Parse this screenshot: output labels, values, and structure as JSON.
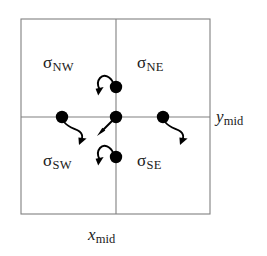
{
  "figure": {
    "background_color": "#ffffff",
    "line_color": "#808080",
    "marker_color": "#000000",
    "text_color": "#1a1a1a",
    "cell": {
      "left": 21,
      "top": 19,
      "right": 210,
      "bottom": 214,
      "mid_x": 116,
      "mid_y": 117
    },
    "quadrant_labels": [
      {
        "id": "sigma-nw",
        "symbol": "σ",
        "subscript": "NW",
        "text": "σNW",
        "quadrant": "north-west"
      },
      {
        "id": "sigma-ne",
        "symbol": "σ",
        "subscript": "NE",
        "text": "σNE",
        "quadrant": "north-east"
      },
      {
        "id": "sigma-sw",
        "symbol": "σ",
        "subscript": "SW",
        "text": "σSW",
        "quadrant": "south-west"
      },
      {
        "id": "sigma-se",
        "symbol": "σ",
        "subscript": "SE",
        "text": "σSE",
        "quadrant": "south-east"
      }
    ],
    "axis_labels": [
      {
        "id": "y-mid",
        "variable": "y",
        "subscript": "mid",
        "text": "ymid",
        "position": "right"
      },
      {
        "id": "x-mid",
        "variable": "x",
        "subscript": "mid",
        "text": "xmid",
        "position": "bottom"
      }
    ],
    "nodes": [
      {
        "id": "node-center",
        "name": "center-node",
        "x": 116,
        "y": 117,
        "radius": 6.2
      },
      {
        "id": "node-north",
        "name": "north-node",
        "x": 116,
        "y": 87,
        "radius": 6.2
      },
      {
        "id": "node-south",
        "name": "south-node",
        "x": 116,
        "y": 157,
        "radius": 6.2
      },
      {
        "id": "node-west",
        "name": "west-node",
        "x": 62,
        "y": 117,
        "radius": 6.2
      },
      {
        "id": "node-east",
        "name": "east-node",
        "x": 163,
        "y": 117,
        "radius": 6.2
      }
    ],
    "arrows": [
      {
        "id": "arrow-center",
        "name": "center-arrow",
        "from_node": "node-center",
        "style": "straight",
        "direction": "down-left"
      },
      {
        "id": "arrow-north",
        "name": "north-arrow",
        "from_node": "node-north",
        "style": "curved",
        "direction": "down-left"
      },
      {
        "id": "arrow-south",
        "name": "south-arrow",
        "from_node": "node-south",
        "style": "curved",
        "direction": "up-left"
      },
      {
        "id": "arrow-west",
        "name": "west-arrow",
        "from_node": "node-west",
        "style": "curved",
        "direction": "down-right"
      },
      {
        "id": "arrow-east",
        "name": "east-arrow",
        "from_node": "node-east",
        "style": "curved",
        "direction": "down-right"
      }
    ]
  }
}
